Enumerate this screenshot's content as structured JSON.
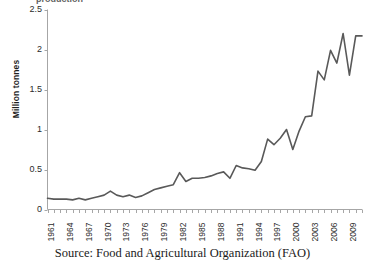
{
  "figure": {
    "caption": "Source: Food and Agricultural Organization (FAO)",
    "clipped_title_fragment": "production"
  },
  "chart_data": {
    "type": "line",
    "title": "",
    "xlabel": "",
    "ylabel": "Million tonnes",
    "ylim": [
      0,
      2.5
    ],
    "yticks": [
      "0",
      "0.5",
      "1",
      "1.5",
      "2",
      "2.5"
    ],
    "ytick_values": [
      0,
      0.5,
      1,
      1.5,
      2,
      2.5
    ],
    "xlim": [
      1961,
      2011
    ],
    "xtick_labels": [
      "1961",
      "1964",
      "1967",
      "1970",
      "1973",
      "1976",
      "1979",
      "1982",
      "1985",
      "1988",
      "1991",
      "1994",
      "1997",
      "2000",
      "2003",
      "2006",
      "2009"
    ],
    "xtick_values": [
      1961,
      1964,
      1967,
      1970,
      1973,
      1976,
      1979,
      1982,
      1985,
      1988,
      1991,
      1994,
      1997,
      2000,
      2003,
      2006,
      2009
    ],
    "xtick_interval_years": 3,
    "minor_tick_interval_years": 1,
    "grid": false,
    "legend": false,
    "line_color": "#595959",
    "line_width": 1.6,
    "axis_color": "#a6a6a6",
    "x": [
      1961,
      1962,
      1963,
      1964,
      1965,
      1966,
      1967,
      1968,
      1969,
      1970,
      1971,
      1972,
      1973,
      1974,
      1975,
      1976,
      1977,
      1978,
      1979,
      1980,
      1981,
      1982,
      1983,
      1984,
      1985,
      1986,
      1987,
      1988,
      1989,
      1990,
      1991,
      1992,
      1993,
      1994,
      1995,
      1996,
      1997,
      1998,
      1999,
      2000,
      2001,
      2002,
      2003,
      2004,
      2005,
      2006,
      2007,
      2008,
      2009,
      2010,
      2011
    ],
    "values": [
      0.14,
      0.13,
      0.13,
      0.13,
      0.12,
      0.14,
      0.12,
      0.14,
      0.16,
      0.18,
      0.23,
      0.18,
      0.16,
      0.18,
      0.15,
      0.17,
      0.21,
      0.25,
      0.27,
      0.29,
      0.31,
      0.46,
      0.35,
      0.39,
      0.39,
      0.4,
      0.42,
      0.45,
      0.47,
      0.39,
      0.55,
      0.52,
      0.51,
      0.49,
      0.6,
      0.88,
      0.81,
      0.89,
      1.0,
      0.75,
      0.98,
      1.16,
      1.17,
      1.73,
      1.62,
      1.99,
      1.83,
      2.2,
      1.68,
      2.17,
      2.17
    ],
    "series": [
      {
        "name": "Production",
        "values": [
          0.14,
          0.13,
          0.13,
          0.13,
          0.12,
          0.14,
          0.12,
          0.14,
          0.16,
          0.18,
          0.23,
          0.18,
          0.16,
          0.18,
          0.15,
          0.17,
          0.21,
          0.25,
          0.27,
          0.29,
          0.31,
          0.46,
          0.35,
          0.39,
          0.39,
          0.4,
          0.42,
          0.45,
          0.47,
          0.39,
          0.55,
          0.52,
          0.51,
          0.49,
          0.6,
          0.88,
          0.81,
          0.89,
          1.0,
          0.75,
          0.98,
          1.16,
          1.17,
          1.73,
          1.62,
          1.99,
          1.83,
          2.2,
          1.68,
          2.17,
          2.17
        ]
      }
    ]
  }
}
